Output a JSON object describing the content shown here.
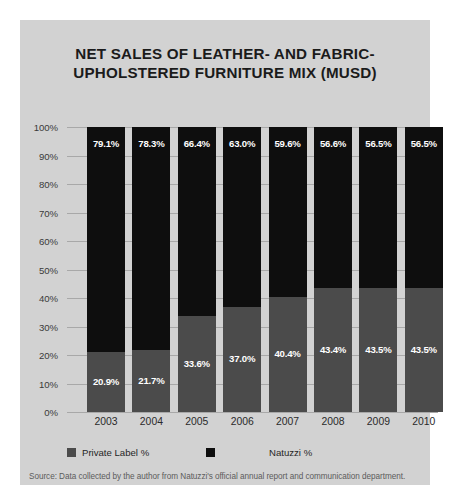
{
  "chart_data": {
    "type": "bar",
    "subtype": "stacked-percentage",
    "title_lines": [
      "NET SALES OF LEATHER- AND FABRIC-",
      "UPHOLSTERED FURNITURE MIX (MUSD)"
    ],
    "xlabel": "",
    "ylabel": "",
    "ylim": [
      0,
      100
    ],
    "ytick_labels": [
      "100%",
      "90%",
      "80%",
      "70%",
      "60%",
      "50%",
      "40%",
      "30%",
      "20%",
      "10%",
      "0%"
    ],
    "ytick_values": [
      100,
      90,
      80,
      70,
      60,
      50,
      40,
      30,
      20,
      10,
      0
    ],
    "grid": true,
    "legend_position": "bottom",
    "categories": [
      "2003",
      "2004",
      "2005",
      "2006",
      "2007",
      "2008",
      "2009",
      "2010"
    ],
    "series": [
      {
        "name": "Private Label %",
        "color": "#4b4b4b",
        "stack_position": "bottom",
        "values": [
          20.9,
          21.7,
          33.6,
          37.0,
          40.4,
          43.4,
          43.5,
          43.5
        ],
        "labels": [
          "20.9%",
          "21.7%",
          "33.6%",
          "37.0%",
          "40.4%",
          "43.4%",
          "43.5%",
          "43.5%"
        ]
      },
      {
        "name": "Natuzzi %",
        "color": "#0e0e0e",
        "stack_position": "top",
        "values": [
          79.1,
          78.3,
          66.4,
          63.0,
          59.6,
          56.6,
          56.5,
          56.5
        ],
        "labels": [
          "79.1%",
          "78.3%",
          "66.4%",
          "63.0%",
          "59.6%",
          "56.6%",
          "56.5%",
          "56.5%"
        ]
      }
    ],
    "source_note": "Source: Data collected by the author from Natuzzi's official annual report and communication department."
  },
  "colors": {
    "panel_background": "#d2d2d2",
    "page_background": "#ffffff",
    "gridline": "#a8a8a8",
    "private_label": "#4b4b4b",
    "natuzzi": "#0e0e0e",
    "title_text": "#1b1b1b",
    "axis_text": "#3a3a3a",
    "source_text": "#5c5c5c",
    "bar_label_text": "#ffffff"
  }
}
